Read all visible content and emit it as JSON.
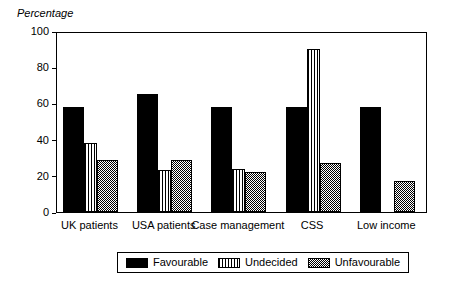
{
  "chart_data": {
    "type": "bar",
    "title": "",
    "xlabel": "",
    "ylabel": "Percentage",
    "ylim": [
      0,
      100
    ],
    "yticks": [
      0,
      20,
      40,
      60,
      80,
      100
    ],
    "grid": false,
    "legend_position": "bottom",
    "categories": [
      "UK patients",
      "USA patients",
      "Case management",
      "CSS",
      "Low income"
    ],
    "series": [
      {
        "name": "Favourable",
        "pattern": "solid-black",
        "values": [
          58,
          65,
          58,
          58,
          58
        ]
      },
      {
        "name": "Undecided",
        "pattern": "vertical-lines",
        "values": [
          38,
          23,
          24,
          90,
          null
        ]
      },
      {
        "name": "Unfavourable",
        "pattern": "checkerboard",
        "values": [
          29,
          29,
          22,
          27,
          17
        ]
      }
    ]
  }
}
